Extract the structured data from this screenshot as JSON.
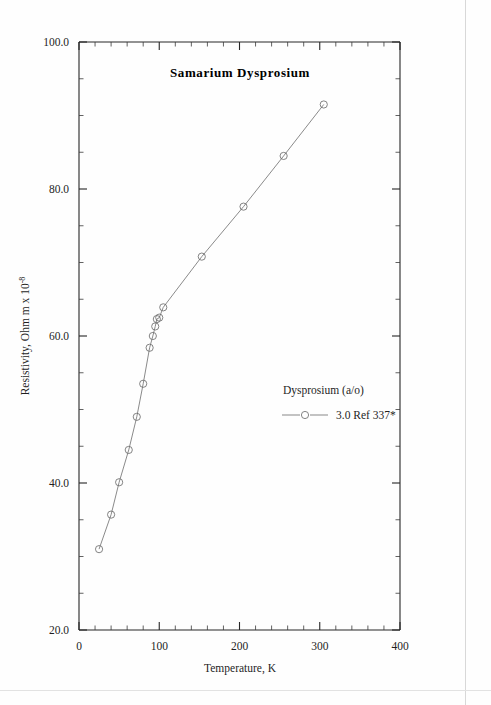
{
  "chart_data": {
    "type": "line",
    "title": "Samarium  Dysprosium",
    "xlabel": "Temperature,  K",
    "ylabel": "Resistivity, Ohm m x 10",
    "ylabel_exponent": "-8",
    "xlim": [
      0,
      400
    ],
    "ylim": [
      20.0,
      100.0
    ],
    "x_major_ticks": [
      0,
      100,
      200,
      300,
      400
    ],
    "x_major_tick_labels": [
      "0",
      "100",
      "200",
      "300",
      "400"
    ],
    "x_minor_interval": 20,
    "y_major_ticks": [
      20.0,
      40.0,
      60.0,
      80.0,
      100.0
    ],
    "y_major_tick_labels": [
      "20.0",
      "40.0",
      "60.0",
      "80.0",
      "100.0"
    ],
    "y_minor_interval": 5,
    "grid": false,
    "legend_position": "inside-right",
    "series": [
      {
        "name": "3.0 Ref 337*",
        "marker": "open-circle",
        "x": [
          25,
          40,
          50,
          62,
          72,
          80,
          88,
          92,
          95,
          97,
          100,
          105,
          153,
          205,
          255,
          305
        ],
        "y": [
          31.0,
          35.7,
          40.1,
          44.5,
          49.0,
          53.5,
          58.4,
          60.0,
          61.3,
          62.3,
          62.5,
          63.9,
          70.8,
          77.6,
          84.5,
          91.5
        ]
      }
    ]
  },
  "legend": {
    "header": "Dysprosium (a/o)",
    "entry_label": "3.0 Ref 337*"
  },
  "colors": {
    "axis": "#262626",
    "data": "#757575",
    "text": "#1f1f1f",
    "background": "#fefefe"
  }
}
